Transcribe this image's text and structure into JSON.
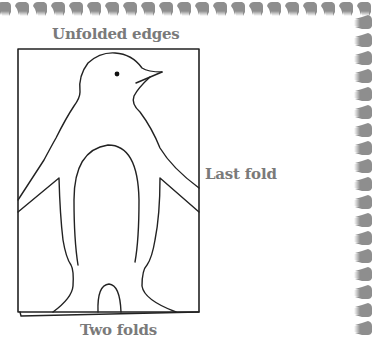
{
  "diagram": {
    "labels": {
      "top": "Unfolded edges",
      "right": "Last fold",
      "bottom": "Two folds"
    },
    "figure": "penguin-cutout-template",
    "border_icon": "hand-icon",
    "colors": {
      "outline": "#222222",
      "label": "#7a7a7a",
      "hand": "#8e8e8e",
      "background": "#ffffff"
    }
  }
}
